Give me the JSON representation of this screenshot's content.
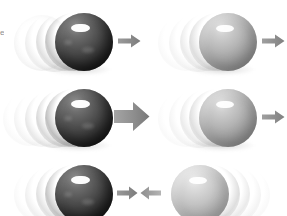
{
  "figure": {
    "edge_fragment_text": "e",
    "background_color": "#ffffff",
    "width": 287,
    "height": 216,
    "rows": 3,
    "columns": 2
  },
  "colors": {
    "dark_sphere": "#2c2c2c",
    "light_sphere": "#a8a8a8",
    "pale_sphere": "#b9b9b9",
    "arrow_gray": "#8c8c8c",
    "arrow_gray_dark": "#7a7a7a",
    "trail_gray": "#d8d8d8",
    "highlight": "#ffffff",
    "background": "#ffffff"
  },
  "panels": [
    {
      "id": "row1-left",
      "row": 1,
      "column": "left",
      "sphere": {
        "name": "dark-sphere",
        "shade": "dark",
        "diameter": 58,
        "center_x": 84,
        "center_y": 38,
        "mass_label": "heavy"
      },
      "motion": {
        "direction": "right",
        "speed_label": "slow",
        "trail_side": "left",
        "trail_count": 4
      },
      "arrow": {
        "name": "velocity-arrow",
        "direction": "right",
        "size": "small",
        "length": 22,
        "thickness": 9
      }
    },
    {
      "id": "row1-right",
      "row": 1,
      "column": "right",
      "sphere": {
        "name": "light-sphere",
        "shade": "light",
        "diameter": 58,
        "center_x": 227,
        "center_y": 38,
        "mass_label": "light"
      },
      "motion": {
        "direction": "right",
        "speed_label": "slow",
        "trail_side": "left",
        "trail_count": 4
      },
      "arrow": {
        "name": "velocity-arrow",
        "direction": "right",
        "size": "small",
        "length": 22,
        "thickness": 9
      }
    },
    {
      "id": "row2-left",
      "row": 2,
      "column": "left",
      "sphere": {
        "name": "dark-sphere",
        "shade": "dark",
        "diameter": 58,
        "center_x": 84,
        "center_y": 38,
        "mass_label": "heavy"
      },
      "motion": {
        "direction": "right",
        "speed_label": "fast",
        "trail_side": "left",
        "trail_count": 5
      },
      "arrow": {
        "name": "velocity-arrow",
        "direction": "right",
        "size": "large",
        "length": 34,
        "thickness": 17
      }
    },
    {
      "id": "row2-right",
      "row": 2,
      "column": "right",
      "sphere": {
        "name": "light-sphere",
        "shade": "light",
        "diameter": 58,
        "center_x": 227,
        "center_y": 38,
        "mass_label": "light"
      },
      "motion": {
        "direction": "right",
        "speed_label": "slow",
        "trail_side": "left",
        "trail_count": 4
      },
      "arrow": {
        "name": "velocity-arrow",
        "direction": "right",
        "size": "small",
        "length": 22,
        "thickness": 9
      }
    },
    {
      "id": "row3-left",
      "row": 3,
      "column": "left",
      "sphere": {
        "name": "dark-sphere",
        "shade": "dark",
        "diameter": 58,
        "center_x": 84,
        "center_y": 38,
        "mass_label": "heavy"
      },
      "motion": {
        "direction": "right",
        "speed_label": "slow",
        "trail_side": "left",
        "trail_count": 4
      },
      "arrow": {
        "name": "velocity-arrow",
        "direction": "right",
        "size": "small",
        "length": 20,
        "thickness": 9
      }
    },
    {
      "id": "row3-right",
      "row": 3,
      "column": "right",
      "sphere": {
        "name": "pale-sphere",
        "shade": "pale",
        "diameter": 58,
        "center_x": 206,
        "center_y": 38,
        "mass_label": "light"
      },
      "motion": {
        "direction": "left",
        "speed_label": "slow",
        "trail_side": "right",
        "trail_count": 4
      },
      "arrow": {
        "name": "velocity-arrow",
        "direction": "left",
        "size": "small",
        "length": 20,
        "thickness": 9
      }
    }
  ]
}
